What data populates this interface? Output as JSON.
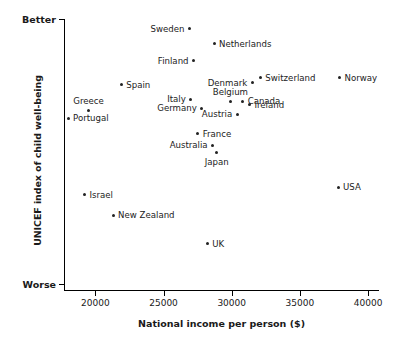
{
  "chart_data": {
    "type": "scatter",
    "title": "",
    "xlabel": "National income per person ($)",
    "ylabel": "UNICEF index of child well-being",
    "xlim": [
      17700,
      40800
    ],
    "ylim": [
      0,
      100
    ],
    "xticks": [
      20000,
      25000,
      30000,
      35000,
      40000
    ],
    "xtick_labels": [
      "20000",
      "25000",
      "30000",
      "35000",
      "40000"
    ],
    "ytick_labels": [
      "Better",
      "Worse"
    ],
    "grid": false,
    "legend": null,
    "points": [
      {
        "label": "Sweden",
        "x": 26900,
        "y": 96.4,
        "label_side": "left"
      },
      {
        "label": "Netherlands",
        "x": 28700,
        "y": 90.8,
        "label_side": "right"
      },
      {
        "label": "Finland",
        "x": 27200,
        "y": 84.6,
        "label_side": "left"
      },
      {
        "label": "Switzerland",
        "x": 32100,
        "y": 78.3,
        "label_side": "right"
      },
      {
        "label": "Norway",
        "x": 37900,
        "y": 78.3,
        "label_side": "right"
      },
      {
        "label": "Denmark",
        "x": 31500,
        "y": 76.4,
        "label_side": "left"
      },
      {
        "label": "Spain",
        "x": 21900,
        "y": 75.7,
        "label_side": "right"
      },
      {
        "label": "Belgium",
        "x": 29900,
        "y": 69.6,
        "label_side": "above"
      },
      {
        "label": "Italy",
        "x": 27000,
        "y": 70.4,
        "label_side": "left"
      },
      {
        "label": "Canada",
        "x": 30800,
        "y": 69.6,
        "label_side": "right"
      },
      {
        "label": "Germany",
        "x": 27800,
        "y": 67.1,
        "label_side": "left"
      },
      {
        "label": "Ireland",
        "x": 31300,
        "y": 68.3,
        "label_side": "right"
      },
      {
        "label": "Austria",
        "x": 30400,
        "y": 64.9,
        "label_side": "left"
      },
      {
        "label": "Greece",
        "x": 19500,
        "y": 66.4,
        "label_side": "above"
      },
      {
        "label": "Portugal",
        "x": 18000,
        "y": 63.4,
        "label_side": "right"
      },
      {
        "label": "France",
        "x": 27500,
        "y": 57.6,
        "label_side": "right"
      },
      {
        "label": "Australia",
        "x": 28600,
        "y": 53.5,
        "label_side": "left"
      },
      {
        "label": "Japan",
        "x": 28900,
        "y": 50.6,
        "label_side": "below"
      },
      {
        "label": "Israel",
        "x": 19200,
        "y": 35.1,
        "label_side": "right"
      },
      {
        "label": "USA",
        "x": 37800,
        "y": 38.0,
        "label_side": "right"
      },
      {
        "label": "New Zealand",
        "x": 21300,
        "y": 27.6,
        "label_side": "right"
      },
      {
        "label": "UK",
        "x": 28200,
        "y": 17.0,
        "label_side": "right"
      }
    ]
  }
}
